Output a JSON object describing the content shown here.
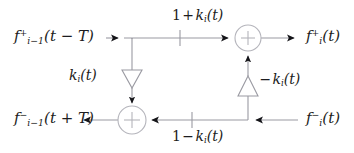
{
  "figure": {
    "kind": "signal-flow-diagram",
    "title": "",
    "background_color": "#ffffff",
    "line_color": "#9a9aa2",
    "text_color": "#1c1c20"
  },
  "labels": {
    "input_forward": {
      "base": "f",
      "superscript": "+",
      "subscript": "i−1",
      "argument": "(t − T)",
      "plain": "f_{i-1}^{+}(t - T)"
    },
    "input_backward": {
      "base": "f",
      "superscript": "−",
      "subscript": "i−1",
      "argument": "(t + T)",
      "plain": "f_{i-1}^{-}(t + T)"
    },
    "output_forward": {
      "base": "f",
      "superscript": "+",
      "subscript": "i",
      "argument": "(t)",
      "plain": "f_{i}^{+}(t)"
    },
    "output_backward": {
      "base": "f",
      "superscript": "−",
      "subscript": "i",
      "argument": "(t)",
      "plain": "f_{i}^{-}(t)"
    },
    "gain_top": {
      "prefix": "1",
      "operator": "+",
      "base": "k",
      "subscript": "i",
      "argument": "(t)",
      "plain": "1 + k_i(t)"
    },
    "gain_bottom": {
      "prefix": "1",
      "operator": "−",
      "base": "k",
      "subscript": "i",
      "argument": "(t)",
      "plain": "1 − k_i(t)"
    },
    "gain_forward_branch": {
      "base": "k",
      "subscript": "i",
      "argument": "(t)",
      "plain": "k_i(t)"
    },
    "gain_backward_branch": {
      "operator": "−",
      "base": "k",
      "subscript": "i",
      "argument": "(t)",
      "plain": "−k_i(t)"
    }
  },
  "nodes": {
    "summer_top": {
      "symbol": "+",
      "x": 248,
      "y": 38,
      "r": 13
    },
    "summer_bottom": {
      "symbol": "+",
      "x": 132,
      "y": 120,
      "r": 14
    }
  },
  "elements": {
    "amplifier_forward": {
      "direction": "down",
      "x": 132,
      "y": 78
    },
    "amplifier_backward": {
      "direction": "up",
      "x": 248,
      "y": 85
    },
    "tick_top": {
      "x": 180,
      "y": 38
    },
    "tick_bottom": {
      "x": 192,
      "y": 120
    }
  }
}
